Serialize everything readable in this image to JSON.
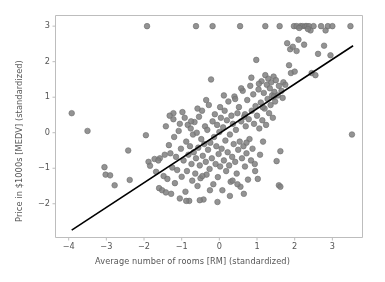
{
  "chart_data": {
    "type": "scatter",
    "title": "",
    "xlabel": "Average number of rooms [RM] (standardized)",
    "ylabel": "Price in $1000s [MEDV] (standardized)",
    "xlim": [
      -4.35,
      3.8
    ],
    "ylim": [
      -2.95,
      3.3
    ],
    "xticks": [
      -4,
      -3,
      -2,
      -1,
      0,
      1,
      2,
      3
    ],
    "yticks": [
      -2,
      -1,
      0,
      1,
      2,
      3
    ],
    "grid": false,
    "legend": null,
    "marker": {
      "shape": "circle",
      "face_color": "#808080",
      "edge_color": "#6e6e6e",
      "size_px": 5.6,
      "alpha": 0.85
    },
    "fit_line": {
      "name": "linear regression",
      "color": "#000000",
      "width_px": 1.6,
      "slope": 0.695,
      "intercept": -0.02,
      "x_start": -3.92,
      "x_end": 3.55
    },
    "series": [
      {
        "name": "RM vs MEDV (standardized)",
        "points": [
          [
            -3.92,
            0.55
          ],
          [
            -3.5,
            0.05
          ],
          [
            -3.05,
            -0.97
          ],
          [
            -3.02,
            -1.18
          ],
          [
            -2.78,
            -1.48
          ],
          [
            -2.42,
            -0.5
          ],
          [
            -2.38,
            -1.33
          ],
          [
            -1.95,
            -0.07
          ],
          [
            -1.92,
            3.0
          ],
          [
            -1.88,
            -0.82
          ],
          [
            -1.84,
            -0.93
          ],
          [
            -1.72,
            -0.74
          ],
          [
            -1.68,
            -1.1
          ],
          [
            -1.6,
            -1.56
          ],
          [
            -1.52,
            -1.62
          ],
          [
            -1.48,
            -1.22
          ],
          [
            -1.45,
            -0.62
          ],
          [
            -1.42,
            0.18
          ],
          [
            -1.38,
            -1.3
          ],
          [
            -1.34,
            -0.35
          ],
          [
            -1.3,
            -0.58
          ],
          [
            -1.28,
            -1.72
          ],
          [
            -1.25,
            -0.98
          ],
          [
            -1.22,
            0.38
          ],
          [
            -1.2,
            -0.12
          ],
          [
            -1.18,
            -1.42
          ],
          [
            -1.15,
            -0.68
          ],
          [
            -1.12,
            -1.05
          ],
          [
            -1.08,
            0.05
          ],
          [
            -1.05,
            -1.85
          ],
          [
            -1.02,
            -0.45
          ],
          [
            -1.0,
            -1.24
          ],
          [
            -0.98,
            0.58
          ],
          [
            -0.95,
            -0.78
          ],
          [
            -0.92,
            0.42
          ],
          [
            -0.9,
            -1.66
          ],
          [
            -0.88,
            -0.25
          ],
          [
            -0.86,
            -1.08
          ],
          [
            -0.84,
            0.22
          ],
          [
            -0.82,
            -0.62
          ],
          [
            -0.8,
            -1.92
          ],
          [
            -0.78,
            -0.38
          ],
          [
            -0.76,
            0.12
          ],
          [
            -0.74,
            -0.88
          ],
          [
            -0.72,
            -1.35
          ],
          [
            -0.7,
            -0.05
          ],
          [
            -0.68,
            -0.55
          ],
          [
            -0.66,
            0.3
          ],
          [
            -0.64,
            -1.15
          ],
          [
            -0.62,
            -0.72
          ],
          [
            -0.6,
            0.0
          ],
          [
            -0.58,
            -1.5
          ],
          [
            -0.56,
            -0.42
          ],
          [
            -0.54,
            0.45
          ],
          [
            -0.52,
            -0.92
          ],
          [
            -0.5,
            -1.28
          ],
          [
            -0.48,
            -0.18
          ],
          [
            -0.46,
            0.62
          ],
          [
            -0.44,
            -0.65
          ],
          [
            -0.42,
            -1.88
          ],
          [
            -0.4,
            -0.32
          ],
          [
            -0.38,
            0.18
          ],
          [
            -0.36,
            -0.82
          ],
          [
            -0.34,
            -1.18
          ],
          [
            -0.32,
            0.08
          ],
          [
            -0.3,
            -0.48
          ],
          [
            -0.28,
            0.78
          ],
          [
            -0.26,
            -1.02
          ],
          [
            -0.24,
            -0.28
          ],
          [
            -0.22,
            1.5
          ],
          [
            -0.2,
            -0.72
          ],
          [
            -0.18,
            0.32
          ],
          [
            -0.16,
            -1.45
          ],
          [
            -0.14,
            -0.12
          ],
          [
            -0.12,
            0.52
          ],
          [
            -0.1,
            -0.88
          ],
          [
            -0.08,
            -0.38
          ],
          [
            -0.06,
            0.22
          ],
          [
            -0.04,
            -1.25
          ],
          [
            -0.02,
            -0.6
          ],
          [
            0.0,
            0.02
          ],
          [
            0.02,
            -0.95
          ],
          [
            0.04,
            0.42
          ],
          [
            0.06,
            -0.45
          ],
          [
            0.08,
            -1.62
          ],
          [
            0.1,
            0.15
          ],
          [
            0.12,
            -0.78
          ],
          [
            0.14,
            0.62
          ],
          [
            0.16,
            -0.22
          ],
          [
            0.18,
            -1.08
          ],
          [
            0.2,
            0.35
          ],
          [
            0.22,
            -0.55
          ],
          [
            0.24,
            0.88
          ],
          [
            0.26,
            -0.92
          ],
          [
            0.28,
            -0.05
          ],
          [
            0.3,
            -1.38
          ],
          [
            0.32,
            0.48
          ],
          [
            0.34,
            -0.68
          ],
          [
            0.36,
            0.25
          ],
          [
            0.38,
            -0.32
          ],
          [
            0.4,
            1.02
          ],
          [
            0.42,
            -0.82
          ],
          [
            0.44,
            0.08
          ],
          [
            0.46,
            -1.15
          ],
          [
            0.48,
            0.55
          ],
          [
            0.5,
            -0.48
          ],
          [
            0.52,
            0.72
          ],
          [
            0.54,
            -0.25
          ],
          [
            0.56,
            -1.52
          ],
          [
            0.58,
            0.32
          ],
          [
            0.6,
            -0.72
          ],
          [
            0.62,
            1.18
          ],
          [
            0.64,
            -0.38
          ],
          [
            0.66,
            0.45
          ],
          [
            0.68,
            -0.95
          ],
          [
            0.7,
            0.18
          ],
          [
            0.72,
            -0.58
          ],
          [
            0.74,
            0.92
          ],
          [
            0.76,
            -1.32
          ],
          [
            0.78,
            0.38
          ],
          [
            0.8,
            -0.18
          ],
          [
            0.82,
            1.32
          ],
          [
            0.84,
            -0.78
          ],
          [
            0.86,
            0.62
          ],
          [
            0.88,
            -0.45
          ],
          [
            0.9,
            1.08
          ],
          [
            0.92,
            0.25
          ],
          [
            0.94,
            -0.88
          ],
          [
            0.96,
            0.75
          ],
          [
            0.98,
            2.05
          ],
          [
            1.0,
            0.48
          ],
          [
            1.02,
            -1.3
          ],
          [
            1.04,
            1.22
          ],
          [
            1.06,
            0.12
          ],
          [
            1.08,
            -0.62
          ],
          [
            1.1,
            0.85
          ],
          [
            1.12,
            1.45
          ],
          [
            1.14,
            0.35
          ],
          [
            1.16,
            -0.25
          ],
          [
            1.18,
            1.12
          ],
          [
            1.2,
            0.68
          ],
          [
            1.22,
            1.62
          ],
          [
            1.24,
            0.22
          ],
          [
            1.26,
            1.35
          ],
          [
            1.28,
            0.95
          ],
          [
            1.3,
            1.52
          ],
          [
            1.32,
            0.55
          ],
          [
            1.34,
            1.25
          ],
          [
            1.36,
            0.78
          ],
          [
            1.38,
            1.42
          ],
          [
            1.4,
            1.05
          ],
          [
            1.42,
            0.42
          ],
          [
            1.44,
            1.58
          ],
          [
            1.46,
            1.15
          ],
          [
            1.48,
            0.88
          ],
          [
            1.5,
            1.48
          ],
          [
            1.52,
            -0.8
          ],
          [
            1.55,
            1.05
          ],
          [
            1.58,
            1.32
          ],
          [
            1.6,
            3.0
          ],
          [
            1.62,
            -0.52
          ],
          [
            1.65,
            1.18
          ],
          [
            1.68,
            0.98
          ],
          [
            1.7,
            1.42
          ],
          [
            1.75,
            1.35
          ],
          [
            1.8,
            2.52
          ],
          [
            1.85,
            1.9
          ],
          [
            1.88,
            2.35
          ],
          [
            1.9,
            1.68
          ],
          [
            1.95,
            2.42
          ],
          [
            1.98,
            3.0
          ],
          [
            2.0,
            1.72
          ],
          [
            2.05,
            2.3
          ],
          [
            2.1,
            2.62
          ],
          [
            2.15,
            3.0
          ],
          [
            2.2,
            3.0
          ],
          [
            2.25,
            2.48
          ],
          [
            2.28,
            3.0
          ],
          [
            2.32,
            3.0
          ],
          [
            2.38,
            3.0
          ],
          [
            2.42,
            2.88
          ],
          [
            2.45,
            1.68
          ],
          [
            2.5,
            3.0
          ],
          [
            2.55,
            1.62
          ],
          [
            2.62,
            2.22
          ],
          [
            2.7,
            3.0
          ],
          [
            2.78,
            2.45
          ],
          [
            2.82,
            2.88
          ],
          [
            2.88,
            3.0
          ],
          [
            2.95,
            2.18
          ],
          [
            3.0,
            3.0
          ],
          [
            3.48,
            3.0
          ],
          [
            3.52,
            -0.05
          ],
          [
            1.58,
            -1.48
          ],
          [
            1.62,
            -1.52
          ],
          [
            0.65,
            -1.72
          ],
          [
            0.28,
            -1.78
          ],
          [
            -0.52,
            -1.9
          ],
          [
            -0.88,
            -1.92
          ],
          [
            -1.42,
            -1.68
          ],
          [
            -1.58,
            -0.72
          ],
          [
            -1.62,
            -0.78
          ],
          [
            -0.18,
            3.0
          ],
          [
            0.55,
            3.0
          ],
          [
            -0.62,
            3.0
          ],
          [
            1.22,
            3.0
          ],
          [
            -1.22,
            0.55
          ],
          [
            -1.32,
            0.48
          ],
          [
            0.42,
            0.95
          ],
          [
            0.58,
            1.25
          ],
          [
            -0.35,
            0.92
          ],
          [
            -0.75,
            0.32
          ],
          [
            0.12,
            1.05
          ],
          [
            0.85,
            1.55
          ],
          [
            1.05,
            1.38
          ],
          [
            -0.05,
            -1.95
          ],
          [
            0.35,
            -1.35
          ],
          [
            -0.25,
            -1.62
          ],
          [
            0.95,
            -1.08
          ],
          [
            0.48,
            -1.45
          ],
          [
            -0.45,
            -1.22
          ],
          [
            0.72,
            -0.28
          ],
          [
            1.15,
            0.72
          ],
          [
            -1.05,
            0.25
          ],
          [
            -0.58,
            0.68
          ],
          [
            0.02,
            0.72
          ],
          [
            0.68,
            0.52
          ],
          [
            1.45,
            1.02
          ],
          [
            2.05,
            3.0
          ],
          [
            2.12,
            2.95
          ],
          [
            2.35,
            2.92
          ],
          [
            -2.9,
            -1.2
          ]
        ]
      }
    ]
  }
}
